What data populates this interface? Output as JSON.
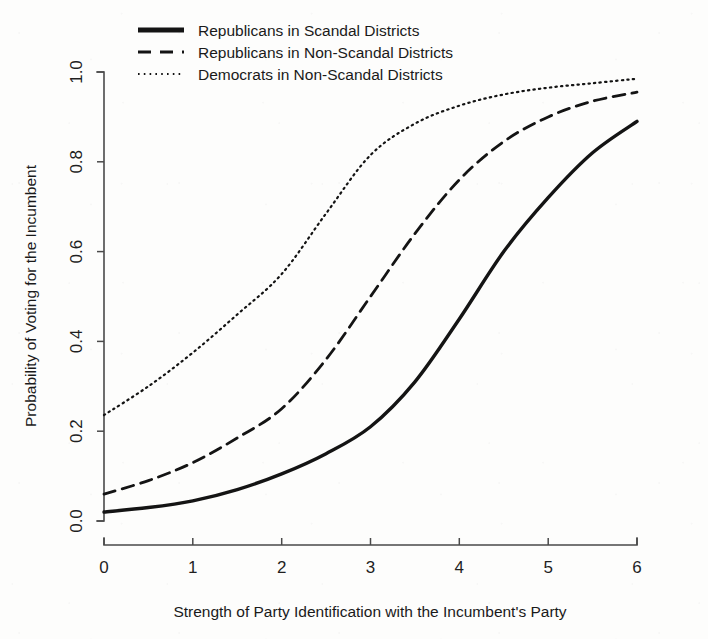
{
  "chart_data": {
    "type": "line",
    "title": "",
    "xlabel": "Strength of Party Identification with the Incumbent's Party",
    "ylabel": "Probability of Voting for the Incumbent",
    "xlim": [
      0,
      6
    ],
    "ylim": [
      0,
      1
    ],
    "grid": false,
    "legend_position": "top-left",
    "xticks": [
      "0",
      "1",
      "2",
      "3",
      "4",
      "5",
      "6"
    ],
    "yticks": [
      "0.0",
      "0.2",
      "0.4",
      "0.6",
      "0.8",
      "1.0"
    ],
    "x": [
      0,
      0.5,
      1,
      1.5,
      2,
      2.5,
      3,
      3.5,
      4,
      4.5,
      5,
      5.5,
      6
    ],
    "series": [
      {
        "name": "Republicans in Scandal Districts",
        "style": "solid",
        "width": 3.4,
        "color": "#141414",
        "values": [
          0.02,
          0.03,
          0.045,
          0.07,
          0.105,
          0.15,
          0.21,
          0.31,
          0.45,
          0.6,
          0.72,
          0.82,
          0.89
        ]
      },
      {
        "name": "Republicans in Non-Scandal Districts",
        "style": "dashed",
        "width": 2.8,
        "color": "#141414",
        "values": [
          0.06,
          0.09,
          0.13,
          0.185,
          0.25,
          0.36,
          0.5,
          0.64,
          0.76,
          0.845,
          0.9,
          0.935,
          0.955
        ]
      },
      {
        "name": "Democrats in Non-Scandal Districts",
        "style": "dotted",
        "width": 2.2,
        "color": "#141414",
        "values": [
          0.236,
          0.3,
          0.375,
          0.46,
          0.55,
          0.685,
          0.815,
          0.885,
          0.925,
          0.95,
          0.965,
          0.975,
          0.985
        ]
      }
    ],
    "legend": [
      {
        "label": "Republicans in Scandal Districts",
        "style": "solid"
      },
      {
        "label": "Republicans in Non-Scandal Districts",
        "style": "dashed"
      },
      {
        "label": "Democrats in Non-Scandal Districts",
        "style": "dotted"
      }
    ]
  }
}
